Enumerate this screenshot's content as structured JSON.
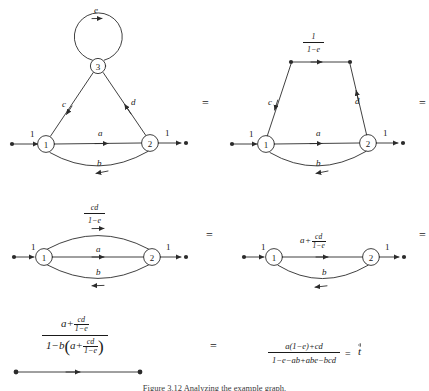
{
  "figure": {
    "caption": "Figure 3.12 Analyzing the example graph.",
    "equals_sign": "="
  },
  "labels": {
    "one": "1",
    "a": "a",
    "b": "b",
    "c": "c",
    "d": "d",
    "e": "e",
    "cd": "cd",
    "one_minus_e": "1−e",
    "numer_one": "1",
    "plus": "+",
    "minus": "−",
    "t_result": "t"
  },
  "nodes": {
    "n1": "1",
    "n2": "2",
    "n3": "3"
  },
  "diagram1": {
    "name": "original-graph",
    "self_loop_label": "e",
    "edges": [
      {
        "from": "source",
        "to": "1",
        "label": "1"
      },
      {
        "from": "1",
        "to": "2",
        "label": "a"
      },
      {
        "from": "2",
        "to": "1",
        "label": "b"
      },
      {
        "from": "3",
        "to": "1",
        "label": "c"
      },
      {
        "from": "2",
        "to": "3",
        "label": "d"
      },
      {
        "from": "3",
        "to": "3",
        "label": "e"
      },
      {
        "from": "2",
        "to": "sink",
        "label": "1"
      }
    ]
  },
  "diagram2": {
    "name": "self-loop-removed-graph",
    "top_edge_numer": "1",
    "top_edge_denom": "1−e",
    "edges": [
      {
        "from": "source",
        "to": "1",
        "label": "1"
      },
      {
        "from": "1",
        "to": "2",
        "label": "a"
      },
      {
        "from": "2",
        "to": "1",
        "label": "b"
      },
      {
        "from": "left-top",
        "to": "1",
        "label": "c"
      },
      {
        "from": "2",
        "to": "right-top",
        "label": "d"
      },
      {
        "from": "2",
        "to": "sink",
        "label": "1"
      }
    ]
  },
  "diagram3": {
    "name": "series-merged-graph",
    "top_edge_numer": "cd",
    "top_edge_denom": "1−e",
    "edges": [
      {
        "from": "source",
        "to": "1",
        "label": "1"
      },
      {
        "from": "1",
        "to": "2",
        "label": "cd/(1−e)"
      },
      {
        "from": "1",
        "to": "2",
        "label": "a"
      },
      {
        "from": "2",
        "to": "1",
        "label": "b"
      },
      {
        "from": "2",
        "to": "sink",
        "label": "1"
      }
    ]
  },
  "diagram4": {
    "name": "parallel-merged-graph",
    "top_edge_lead": "a",
    "top_edge_op": "+",
    "top_edge_numer": "cd",
    "top_edge_denom": "1−e",
    "bottom_edge_label": "b",
    "edges": [
      {
        "from": "source",
        "to": "1",
        "label": "1"
      },
      {
        "from": "1",
        "to": "2",
        "label": "a + cd/(1−e)"
      },
      {
        "from": "2",
        "to": "1",
        "label": "b"
      },
      {
        "from": "2",
        "to": "sink",
        "label": "1"
      }
    ]
  },
  "diagram5": {
    "name": "final-single-edge-graph",
    "numerator": {
      "lead": "a",
      "op": "+",
      "frac_num": "cd",
      "frac_den": "1−e"
    },
    "denominator": {
      "lead": "1",
      "op": "−",
      "b": "b",
      "open_paren": "(",
      "inner_lead": "a",
      "inner_op": "+",
      "inner_frac_num": "cd",
      "inner_frac_den": "1−e",
      "close_paren": ")"
    }
  },
  "final_expression": {
    "name": "closed-form-result",
    "numerator": "a(1−e)+cd",
    "denominator": "1−e−ab+abe−bcd",
    "equals": "=",
    "result_symbol": "t"
  }
}
